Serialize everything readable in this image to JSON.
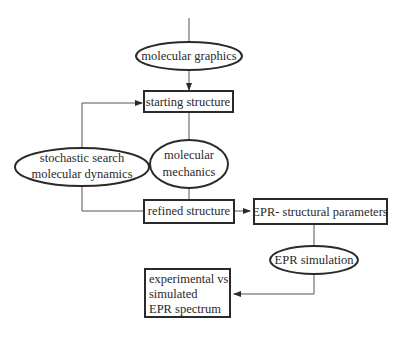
{
  "diagram": {
    "type": "flowchart",
    "nodes": [
      {
        "id": "molecular-graphics",
        "shape": "ellipse",
        "label": "molecular graphics"
      },
      {
        "id": "starting-structure",
        "shape": "box",
        "label": "starting structure"
      },
      {
        "id": "stochastic-search",
        "shape": "ellipse",
        "lines": [
          "stochastic search",
          "molecular dynamics"
        ]
      },
      {
        "id": "molecular-mechanics",
        "shape": "ellipse",
        "lines": [
          "molecular",
          "mechanics"
        ]
      },
      {
        "id": "refined-structure",
        "shape": "box",
        "label": "refined structure"
      },
      {
        "id": "epr-structural-parameters",
        "shape": "box",
        "label": "EPR- structural parameters"
      },
      {
        "id": "epr-simulation",
        "shape": "ellipse",
        "label": "EPR simulation"
      },
      {
        "id": "experimental-vs-simulated",
        "shape": "box",
        "lines": [
          "experimental vs.",
          "simulated",
          "EPR spectrum"
        ]
      }
    ],
    "edges": [
      {
        "from": "molecular-graphics",
        "to": "starting-structure",
        "arrow": true
      },
      {
        "from": "starting-structure",
        "to": "molecular-mechanics",
        "arrow": false
      },
      {
        "from": "molecular-mechanics",
        "to": "refined-structure",
        "arrow": false
      },
      {
        "from": "refined-structure",
        "to": "stochastic-search",
        "arrow": false
      },
      {
        "from": "stochastic-search",
        "to": "starting-structure",
        "arrow": true
      },
      {
        "from": "refined-structure",
        "to": "epr-structural-parameters",
        "arrow": true
      },
      {
        "from": "epr-structural-parameters",
        "to": "epr-simulation",
        "arrow": false
      },
      {
        "from": "epr-simulation",
        "to": "experimental-vs-simulated",
        "arrow": true
      }
    ],
    "colors": {
      "stroke": "#2a2a2a",
      "text": "#2a2a2a",
      "background": "#ffffff"
    }
  }
}
